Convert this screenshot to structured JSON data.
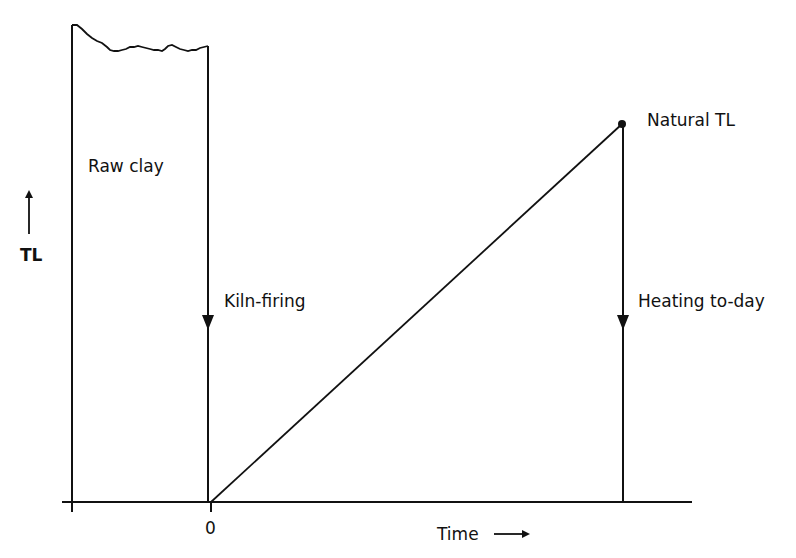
{
  "diagram": {
    "type": "thermoluminescence-dating-schematic",
    "y_axis": {
      "label": "TL",
      "arrow": "up"
    },
    "x_axis": {
      "label": "Time",
      "arrow": "right",
      "tick_labels": [
        "0"
      ]
    },
    "labels": {
      "raw_clay": "Raw clay",
      "kiln_firing": "Kiln-firing",
      "natural_tl": "Natural TL",
      "heating_today": "Heating to-day"
    },
    "stages": [
      {
        "name": "Raw clay",
        "description": "High geological TL plateau before firing"
      },
      {
        "name": "Kiln-firing",
        "description": "TL drops to zero at time 0"
      },
      {
        "name": "Accumulation",
        "description": "TL rises linearly with time"
      },
      {
        "name": "Natural TL",
        "description": "Accumulated TL level at present"
      },
      {
        "name": "Heating to-day",
        "description": "Laboratory heating releases TL back to zero"
      }
    ],
    "colors": {
      "line": "#111111",
      "background": "#ffffff"
    }
  }
}
